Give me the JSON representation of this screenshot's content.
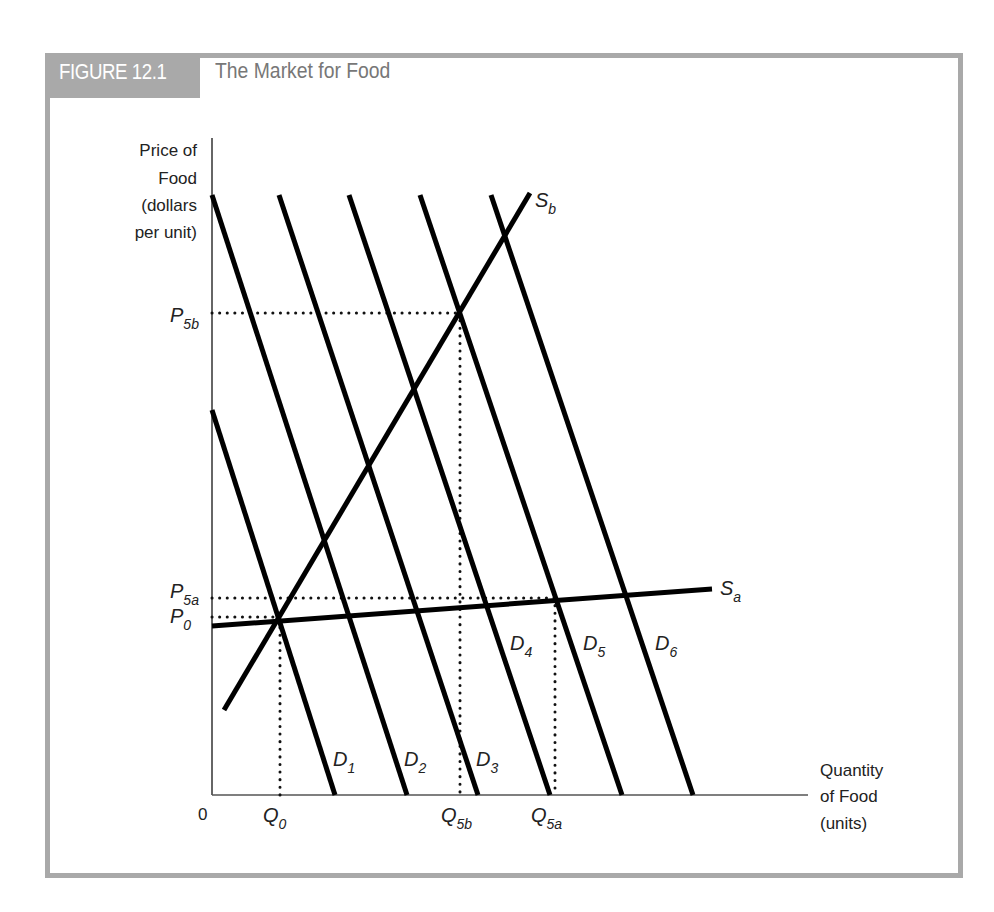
{
  "figure": {
    "badge": "FIGURE 12.1",
    "title": "The Market for Food",
    "frame_color": "#a9a9a9"
  },
  "axes": {
    "y_label": [
      "Price of",
      "Food",
      "(dollars",
      "per unit)"
    ],
    "x_label": [
      "Quantity",
      "of Food",
      "(units)"
    ],
    "origin": "0"
  },
  "chart_data": {
    "type": "line",
    "title": "The Market for Food",
    "xlabel": "Quantity of Food (units)",
    "ylabel": "Price of Food (dollars per unit)",
    "grid": false,
    "legend": "inline labels at line ends",
    "y_ticks": [
      {
        "label": "P5b",
        "main": "P",
        "sub": "5b",
        "y_px": 313
      },
      {
        "label": "P5a",
        "main": "P",
        "sub": "5a",
        "y_px": 598
      },
      {
        "label": "P0",
        "main": "P",
        "sub": "0",
        "y_px": 617
      }
    ],
    "x_ticks": [
      {
        "label": "Q0",
        "main": "Q",
        "sub": "0",
        "x_px": 280
      },
      {
        "label": "Q5b",
        "main": "Q",
        "sub": "5b",
        "x_px": 460
      },
      {
        "label": "Q5a",
        "main": "Q",
        "sub": "5a",
        "x_px": 555
      }
    ],
    "series": [
      {
        "name": "D1",
        "main": "D",
        "sub": "1",
        "kind": "demand",
        "points": [
          [
            212,
            410
          ],
          [
            335,
            795
          ]
        ]
      },
      {
        "name": "D2",
        "main": "D",
        "sub": "2",
        "kind": "demand",
        "points": [
          [
            212,
            195
          ],
          [
            407,
            795
          ]
        ]
      },
      {
        "name": "D3",
        "main": "D",
        "sub": "3",
        "kind": "demand",
        "points": [
          [
            279,
            195
          ],
          [
            478,
            795
          ]
        ]
      },
      {
        "name": "D4",
        "main": "D",
        "sub": "4",
        "kind": "demand",
        "points": [
          [
            349,
            195
          ],
          [
            550,
            795
          ]
        ]
      },
      {
        "name": "D5",
        "main": "D",
        "sub": "5",
        "kind": "demand",
        "points": [
          [
            420,
            195
          ],
          [
            622,
            795
          ]
        ]
      },
      {
        "name": "D6",
        "main": "D",
        "sub": "6",
        "kind": "demand",
        "points": [
          [
            491,
            195
          ],
          [
            693,
            795
          ]
        ]
      },
      {
        "name": "Sa",
        "main": "S",
        "sub": "a",
        "kind": "supply",
        "points": [
          [
            212,
            626
          ],
          [
            712,
            589
          ]
        ]
      },
      {
        "name": "Sb",
        "main": "S",
        "sub": "b",
        "kind": "supply",
        "points": [
          [
            224,
            710
          ],
          [
            530,
            193
          ]
        ]
      }
    ],
    "guides": [
      {
        "name": "P5b-line",
        "points": [
          [
            212,
            313
          ],
          [
            459,
            313
          ]
        ]
      },
      {
        "name": "P5a-line",
        "points": [
          [
            212,
            598
          ],
          [
            555,
            598
          ]
        ]
      },
      {
        "name": "P0-line",
        "points": [
          [
            212,
            617
          ],
          [
            278,
            617
          ]
        ]
      },
      {
        "name": "Q0-line",
        "points": [
          [
            280,
            620
          ],
          [
            280,
            795
          ]
        ]
      },
      {
        "name": "Q5b-line",
        "points": [
          [
            460,
            313
          ],
          [
            460,
            795
          ]
        ]
      },
      {
        "name": "Q5a-line",
        "points": [
          [
            555,
            598
          ],
          [
            555,
            795
          ]
        ]
      }
    ],
    "equilibria": [
      {
        "name": "E0",
        "at": [
          "Q0",
          "P0"
        ]
      },
      {
        "name": "E5b",
        "at": [
          "Q5b",
          "P5b"
        ]
      },
      {
        "name": "E5a",
        "at": [
          "Q5a",
          "P5a"
        ]
      }
    ],
    "axis_px": {
      "origin": [
        212,
        795
      ],
      "x_end": 808,
      "y_top": 138
    }
  }
}
